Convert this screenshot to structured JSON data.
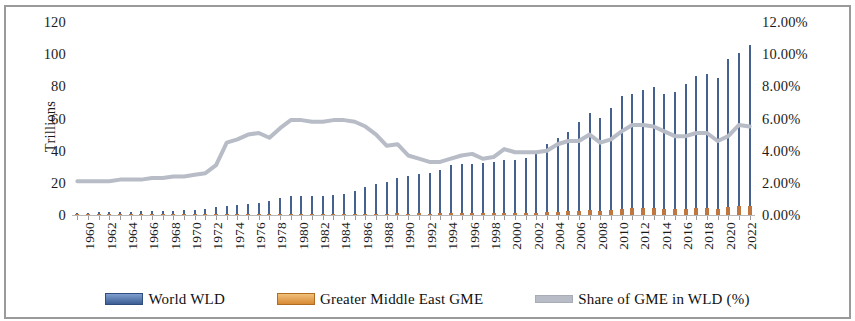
{
  "chart_data": {
    "type": "bar",
    "title": "",
    "subtitle": "",
    "xlabel": "",
    "ylabel": "Trillions",
    "y2label": "",
    "ylim": [
      0,
      120
    ],
    "y2lim": [
      0,
      12
    ],
    "grid": false,
    "legend_position": "bottom",
    "y_ticks": [
      "0",
      "20",
      "40",
      "60",
      "80",
      "100",
      "120"
    ],
    "y_tick_values": [
      0,
      20,
      40,
      60,
      80,
      100,
      120
    ],
    "y2_ticks": [
      "0.00%",
      "2.00%",
      "4.00%",
      "6.00%",
      "8.00%",
      "10.00%",
      "12.00%"
    ],
    "y2_tick_values": [
      0,
      2,
      4,
      6,
      8,
      10,
      12
    ],
    "x": [
      1960,
      1961,
      1962,
      1963,
      1964,
      1965,
      1966,
      1967,
      1968,
      1969,
      1970,
      1971,
      1972,
      1973,
      1974,
      1975,
      1976,
      1977,
      1978,
      1979,
      1980,
      1981,
      1982,
      1983,
      1984,
      1985,
      1986,
      1987,
      1988,
      1989,
      1990,
      1991,
      1992,
      1993,
      1994,
      1995,
      1996,
      1997,
      1998,
      1999,
      2000,
      2001,
      2002,
      2003,
      2004,
      2005,
      2006,
      2007,
      2008,
      2009,
      2010,
      2011,
      2012,
      2013,
      2014,
      2015,
      2016,
      2017,
      2018,
      2019,
      2020,
      2021,
      2022,
      2023
    ],
    "x_tick_labels": [
      "1960",
      "1962",
      "1964",
      "1966",
      "1968",
      "1970",
      "1972",
      "1974",
      "1976",
      "1978",
      "1980",
      "1982",
      "1984",
      "1986",
      "1988",
      "1990",
      "1992",
      "1994",
      "1996",
      "1998",
      "2000",
      "2002",
      "2004",
      "2006",
      "2008",
      "2010",
      "2012",
      "2014",
      "2016",
      "2018",
      "2020",
      "2022"
    ],
    "series": [
      {
        "name": "World WLD",
        "axis": "left",
        "kind": "bar",
        "color": "#44618f",
        "units": "Trillions",
        "values": [
          1.4,
          1.5,
          1.6,
          1.7,
          1.9,
          2.0,
          2.2,
          2.4,
          2.6,
          2.8,
          3.1,
          3.4,
          3.9,
          4.8,
          5.5,
          6.1,
          6.6,
          7.5,
          9.0,
          10.4,
          11.6,
          11.8,
          11.7,
          12.0,
          12.4,
          13.0,
          15.2,
          17.3,
          19.5,
          20.5,
          23.0,
          24.0,
          25.5,
          25.9,
          27.8,
          31.0,
          31.8,
          31.8,
          32.2,
          33.2,
          34.0,
          34.1,
          35.4,
          39.1,
          43.9,
          47.7,
          51.5,
          58.0,
          63.6,
          60.4,
          66.6,
          73.9,
          75.5,
          77.6,
          79.6,
          75.4,
          76.5,
          81.4,
          86.4,
          87.6,
          85.2,
          97.0,
          101.0,
          105.4
        ]
      },
      {
        "name": "Greater Middle East  GME",
        "axis": "left",
        "kind": "bar",
        "color": "#c0773f",
        "units": "Trillions",
        "values": [
          0.03,
          0.03,
          0.04,
          0.04,
          0.04,
          0.05,
          0.05,
          0.06,
          0.06,
          0.07,
          0.08,
          0.09,
          0.11,
          0.16,
          0.26,
          0.29,
          0.34,
          0.39,
          0.44,
          0.58,
          0.7,
          0.7,
          0.66,
          0.65,
          0.66,
          0.67,
          0.73,
          0.8,
          0.85,
          0.88,
          0.99,
          0.89,
          0.95,
          0.93,
          0.98,
          1.12,
          1.22,
          1.25,
          1.12,
          1.2,
          1.39,
          1.34,
          1.37,
          1.52,
          1.77,
          2.08,
          2.36,
          2.67,
          3.15,
          2.7,
          3.12,
          3.85,
          4.2,
          4.28,
          4.3,
          3.72,
          3.63,
          3.92,
          4.44,
          4.48,
          3.87,
          4.75,
          5.68,
          5.8
        ]
      },
      {
        "name": "Share of GME  in WLD (%)",
        "axis": "right",
        "kind": "line",
        "color": "#b7bcc6",
        "units": "%",
        "values": [
          2.1,
          2.1,
          2.1,
          2.1,
          2.2,
          2.2,
          2.2,
          2.3,
          2.3,
          2.4,
          2.4,
          2.5,
          2.6,
          3.1,
          4.5,
          4.7,
          5.0,
          5.1,
          4.8,
          5.4,
          5.9,
          5.9,
          5.8,
          5.8,
          5.9,
          5.9,
          5.8,
          5.5,
          5.0,
          4.3,
          4.4,
          3.7,
          3.5,
          3.3,
          3.3,
          3.5,
          3.7,
          3.8,
          3.5,
          3.6,
          4.1,
          3.9,
          3.9,
          3.9,
          4.0,
          4.4,
          4.6,
          4.6,
          5.0,
          4.5,
          4.7,
          5.2,
          5.6,
          5.6,
          5.5,
          5.2,
          4.9,
          4.9,
          5.1,
          5.1,
          4.6,
          4.9,
          5.6,
          5.5
        ]
      }
    ]
  },
  "axes": {
    "left_title": "Trillions"
  },
  "legend": {
    "items": [
      {
        "label": "World WLD",
        "color": "#44618f",
        "marker": "bar-swatch"
      },
      {
        "label": "Greater Middle East  GME",
        "color": "#c0773f",
        "marker": "bar-swatch"
      },
      {
        "label": "Share of GME  in WLD (%)",
        "color": "#b7bcc6",
        "marker": "line-swatch"
      }
    ]
  }
}
